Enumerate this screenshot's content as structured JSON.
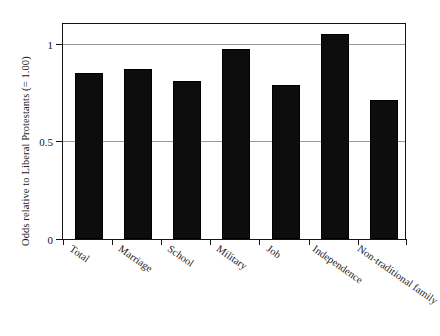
{
  "chart_data": {
    "type": "bar",
    "title": "",
    "subtitle": "",
    "xlabel": "",
    "ylabel": "Odds relative to Liberal Protestants (= 1.00)",
    "categories": [
      "Total",
      "Marriage",
      "School",
      "Military",
      "Job",
      "Independence",
      "Non-traditional family"
    ],
    "values": [
      0.85,
      0.87,
      0.81,
      0.97,
      0.79,
      1.05,
      0.71
    ],
    "ylim": [
      0,
      1.1
    ],
    "yticks": [
      0,
      0.5,
      1
    ],
    "ytick_labels": [
      "0",
      "0.5",
      "1"
    ],
    "grid": "horizontal-at-yticks",
    "legend": "none",
    "bar_color": "#0d0d0d",
    "gridline_color": "#9a9a9a",
    "axis_color": "#141414",
    "background": "#ffffff",
    "reference_line_value": 1.0,
    "annotations": []
  },
  "figure": {
    "axis_title_y": "Odds relative to Liberal Protestants (= 1.00)",
    "tick_0": "0",
    "tick_05": "0.5",
    "tick_1": "1",
    "cat_0": "Total",
    "cat_1": "Marriage",
    "cat_2": "School",
    "cat_3": "Military",
    "cat_4": "Job",
    "cat_5": "Independence",
    "cat_6": "Non-traditional family"
  }
}
